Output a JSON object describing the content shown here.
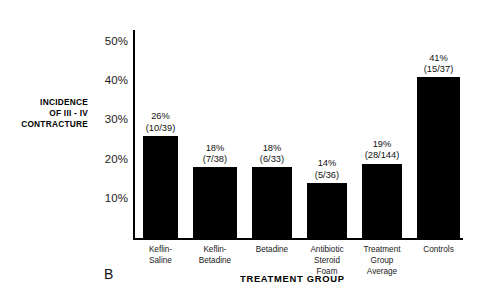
{
  "panel": {
    "letter": "B"
  },
  "chart_data": {
    "type": "bar",
    "title": "",
    "subtitle": "",
    "xlabel": "TREATMENT GROUP",
    "ylabel": "INCIDENCE OF III - IV CONTRACTURE",
    "ylabel_lines": [
      "INCIDENCE",
      "OF III - IV",
      "CONTRACTURE"
    ],
    "categories": [
      "Keflin-\nSaline",
      "Keflin-\nBetadine",
      "Betadine",
      "Antibiotic\nSteroid\nFoam",
      "Treatment\nGroup\nAverage",
      "Controls"
    ],
    "category_lines": [
      [
        "Keflin-",
        "Saline"
      ],
      [
        "Keflin-",
        "Betadine"
      ],
      [
        "Betadine"
      ],
      [
        "Antibiotic",
        "Steroid",
        "Foam"
      ],
      [
        "Treatment",
        "Group",
        "Average"
      ],
      [
        "Controls"
      ]
    ],
    "values": [
      26,
      18,
      18,
      14,
      19,
      41
    ],
    "value_labels": [
      "26%",
      "18%",
      "18%",
      "14%",
      "19%",
      "41%"
    ],
    "fraction_labels": [
      "(10/39)",
      "(7/38)",
      "(6/33)",
      "(5/36)",
      "(28/144)",
      "(15/37)"
    ],
    "numerators": [
      10,
      7,
      6,
      5,
      28,
      15
    ],
    "denominators": [
      39,
      38,
      33,
      36,
      144,
      37
    ],
    "ylim": [
      0,
      52
    ],
    "yticks": [
      10,
      20,
      30,
      40,
      50
    ],
    "ytick_labels": [
      "10%",
      "20%",
      "30%",
      "40%",
      "50%"
    ],
    "grid": false,
    "legend": null,
    "bar_color": "#000000",
    "axis_color": "#000000",
    "background": "#ffffff"
  }
}
